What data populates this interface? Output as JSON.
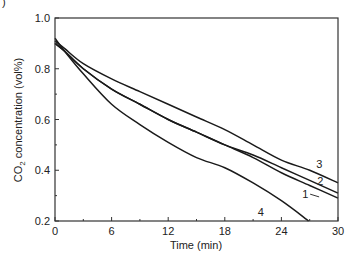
{
  "chart_data": {
    "type": "line",
    "title": "",
    "xlabel": "Time (min)",
    "ylabel": "CO2 concentration (vol%)",
    "ylabel_parts": {
      "pre": "CO",
      "sub": "2",
      "post": " concentration (vol%)"
    },
    "xlim": [
      0,
      30
    ],
    "ylim": [
      0.2,
      1.0
    ],
    "x_ticks": [
      0,
      6,
      12,
      18,
      24,
      30
    ],
    "x_tick_labels": [
      "0",
      "6",
      "12",
      "18",
      "24",
      "30"
    ],
    "x_minor_step": 3,
    "y_ticks": [
      0.2,
      0.4,
      0.6,
      0.8,
      1.0
    ],
    "y_tick_labels": [
      "0.2",
      "0.4",
      "0.6",
      "0.8",
      "1.0"
    ],
    "y_minor_step": 0.1,
    "grid": false,
    "legend": "inline curve labels",
    "series": [
      {
        "name": "1",
        "x": [
          0,
          1,
          3,
          6,
          9,
          12,
          15,
          18,
          21,
          24,
          27,
          30
        ],
        "values": [
          0.9,
          0.87,
          0.8,
          0.72,
          0.66,
          0.6,
          0.55,
          0.5,
          0.45,
          0.39,
          0.34,
          0.29
        ]
      },
      {
        "name": "2",
        "x": [
          0,
          1,
          3,
          6,
          9,
          12,
          15,
          18,
          21,
          24,
          27,
          30
        ],
        "values": [
          0.9,
          0.87,
          0.8,
          0.72,
          0.66,
          0.6,
          0.55,
          0.5,
          0.46,
          0.41,
          0.36,
          0.31
        ]
      },
      {
        "name": "3",
        "x": [
          0,
          1,
          3,
          6,
          9,
          12,
          15,
          18,
          21,
          24,
          27,
          30
        ],
        "values": [
          0.91,
          0.88,
          0.82,
          0.76,
          0.71,
          0.66,
          0.61,
          0.56,
          0.5,
          0.44,
          0.4,
          0.35
        ]
      },
      {
        "name": "4",
        "x": [
          0,
          1,
          3,
          6,
          9,
          12,
          15,
          18,
          21,
          24,
          26.9
        ],
        "values": [
          0.92,
          0.87,
          0.78,
          0.66,
          0.58,
          0.51,
          0.45,
          0.41,
          0.35,
          0.28,
          0.2
        ]
      }
    ],
    "annotations": [
      {
        "text": "1",
        "x": 26.2,
        "y": 0.29
      },
      {
        "text": "2",
        "x": 27.8,
        "y": 0.34
      },
      {
        "text": "3",
        "x": 27.7,
        "y": 0.41
      },
      {
        "text": "4",
        "x": 21.5,
        "y": 0.22
      }
    ]
  },
  "panel_mark": ")"
}
